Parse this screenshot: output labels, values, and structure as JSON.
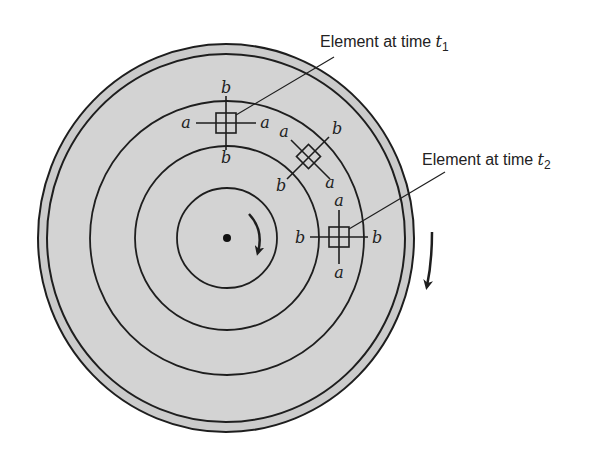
{
  "figure": {
    "type": "rotating-disc-strain-diagram",
    "colors": {
      "disc_fill": "#d3d3d3",
      "rim_fill": "#cbcbcb",
      "line": "#1e1e1e",
      "background": "#ffffff"
    },
    "callouts": [
      {
        "id": "t1",
        "text": "Element at time ",
        "var": "t",
        "sub": "1"
      },
      {
        "id": "t2",
        "text": "Element at time ",
        "var": "t",
        "sub": "2"
      }
    ],
    "element_t1": {
      "labels": {
        "top": "b",
        "left": "a",
        "right": "a",
        "bottom": "b"
      }
    },
    "element_mid": {
      "labels": {
        "upper_left": "a",
        "upper_right": "b",
        "lower_left": "b",
        "lower_right": "a"
      }
    },
    "element_t2": {
      "labels": {
        "top": "a",
        "left": "b",
        "right": "b",
        "bottom": "a"
      }
    },
    "rotation": {
      "direction": "clockwise"
    }
  }
}
